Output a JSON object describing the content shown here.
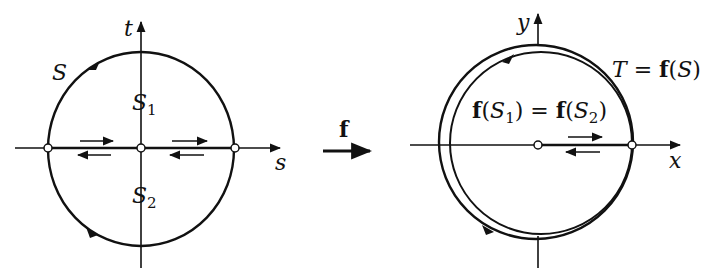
{
  "left_panel": {
    "axis_horizontal_label": "s",
    "axis_vertical_label": "t",
    "curve_label": "S",
    "upper_region_label": {
      "base": "S",
      "sub": "1"
    },
    "lower_region_label": {
      "base": "S",
      "sub": "2"
    }
  },
  "mapping": {
    "label": "f"
  },
  "right_panel": {
    "axis_horizontal_label": "x",
    "axis_vertical_label": "y",
    "image_curve_label": {
      "lhs": "T",
      "eq": " = ",
      "fn": "f",
      "arg": "(S)"
    },
    "image_region_label": {
      "fn1": "f",
      "arg1_open": "(",
      "base1": "S",
      "sub1": "1",
      "arg1_close": ")",
      "eq": " = ",
      "fn2": "f",
      "arg2_open": "(",
      "base2": "S",
      "sub2": "2",
      "arg2_close": ")"
    }
  },
  "colors": {
    "ink": "#111111",
    "background": "#ffffff"
  }
}
